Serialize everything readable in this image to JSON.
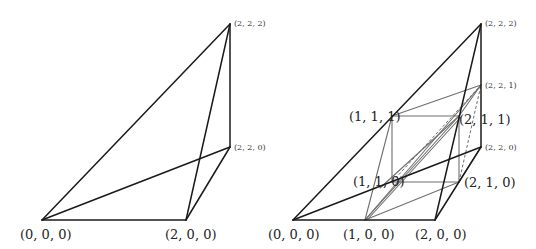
{
  "left_figure": {
    "labels": {
      "p000": "(0, 0, 0)",
      "p200": "(2, 0, 0)",
      "p222": "(2, 2, 2)",
      "p220": "(2, 2, 0)"
    }
  },
  "right_figure": {
    "labels": {
      "p000": "(0, 0, 0)",
      "p100": "(1, 0, 0)",
      "p200": "(2, 0, 0)",
      "p222": "(2, 2, 2)",
      "p221": "(2, 2, 1)",
      "p220": "(2, 2, 0)",
      "p111": "(1, 1, 1)",
      "p211": "(2, 1, 1)",
      "p110": "(1, 1, 0)",
      "p210": "(2, 1, 0)"
    }
  },
  "colors": {
    "outer_edge": "#1a1a1a",
    "inner_edge": "#6e6e6e"
  }
}
